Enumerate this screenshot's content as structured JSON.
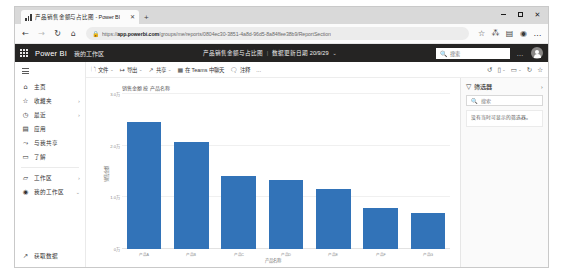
{
  "browser": {
    "tab": {
      "title": "产品销售金额与占比图 - Power BI",
      "favicon": "chart-bars-icon",
      "close": "✕"
    },
    "new_tab": "+",
    "window_controls": {
      "minimize": "minimize-icon",
      "maximize": "maximize-icon",
      "close": "✕"
    },
    "nav": {
      "back": "←",
      "forward": "→",
      "reload": "↻",
      "home": "⌂"
    },
    "url": {
      "lock": "🔒",
      "scheme": "https://",
      "host": "app.powerbi.com",
      "path": "/groups/me/reports/0804ec30-3851-4a8d-96d5-8a84ffee38b9/ReportSection"
    },
    "addr_icons": {
      "favorite": "☆",
      "collections": "⁂",
      "favorites_bar": "▤",
      "profile": "◉",
      "more": "…"
    }
  },
  "topbar": {
    "waffle": "app-launcher-icon",
    "brand": "Power BI",
    "workspace": "我的工作区",
    "report_name": "产品销售金额与占比图",
    "divider": "|",
    "refresh_label": "数据更新日期 20/9/29",
    "chevron": "⌄",
    "search_placeholder": "搜索",
    "search_icon": "🔍",
    "more": "…",
    "avatar": "user-avatar"
  },
  "sidebar": {
    "hamburger": "hamburger-icon",
    "items": [
      {
        "icon": "⌂",
        "label": "主页",
        "chevron": ""
      },
      {
        "icon": "☆",
        "label": "收藏夹",
        "chevron": "›"
      },
      {
        "icon": "◷",
        "label": "最近",
        "chevron": "›"
      },
      {
        "icon": "▤",
        "label": "应用",
        "chevron": ""
      },
      {
        "icon": "⤳",
        "label": "与我共享",
        "chevron": ""
      },
      {
        "icon": "▭",
        "label": "了解",
        "chevron": ""
      }
    ],
    "items2": [
      {
        "icon": "▱",
        "label": "工作区",
        "chevron": "›"
      },
      {
        "icon": "◉",
        "label": "我的工作区",
        "chevron": "⌄"
      }
    ],
    "bottom": {
      "icon": "↗",
      "label": "获取数据"
    }
  },
  "report_toolbar": {
    "items": [
      {
        "icon": "🗋",
        "label": "文件",
        "caret": "⌄"
      },
      {
        "icon": "↦",
        "label": "导出",
        "caret": "⌄"
      },
      {
        "icon": "↗",
        "label": "共享",
        "caret": "⌄"
      },
      {
        "icon": "▦",
        "label": "在 Teams 中聊天",
        "caret": ""
      },
      {
        "icon": "🗨",
        "label": "注释",
        "caret": ""
      }
    ],
    "more": "…",
    "right_icons": [
      {
        "name": "reset-icon",
        "glyph": "↺"
      },
      {
        "name": "bookmark-view-icon",
        "glyph": "▯",
        "caret": "⌄"
      },
      {
        "name": "view-icon",
        "glyph": "▭",
        "caret": "⌄"
      },
      {
        "name": "refresh-icon",
        "glyph": "↻"
      },
      {
        "name": "favorite-icon",
        "glyph": "☆"
      }
    ]
  },
  "filters": {
    "icon": "▽",
    "title": "筛选器",
    "expand": "›",
    "search_icon": "🔍",
    "search_placeholder": "搜索",
    "empty_text": "没有当时可显示的筛选器。"
  },
  "chart_data": {
    "type": "bar",
    "title": "销售金额 按 产品名称",
    "xlabel": "产品名称",
    "ylabel": "销售金额",
    "categories": [
      "产品A",
      "产品B",
      "产品C",
      "产品D",
      "产品E",
      "产品F",
      "产品G"
    ],
    "values": [
      24500,
      20800,
      14200,
      13400,
      11600,
      7900,
      6900
    ],
    "ylim": [
      0,
      30000
    ],
    "yticks": [
      0,
      10000,
      20000,
      30000
    ],
    "ytick_labels": [
      "0万",
      "1.0万",
      "2.0万",
      "3.0万"
    ],
    "bar_color": "#3273b8",
    "grid": true,
    "legend": "none"
  }
}
